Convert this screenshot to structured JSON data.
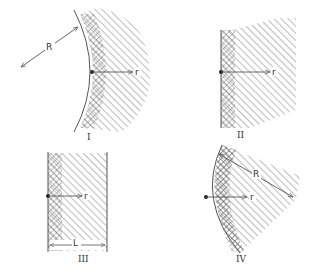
{
  "colors": {
    "line": "#555555",
    "hatch": "#777777",
    "background": "#ffffff"
  },
  "panels": [
    {
      "id": "I",
      "label": "I",
      "description": "Concave cylindrical surface (center of curvature to the left) with radius R; cross-hatched boundary layer and diagonally hatched region; radial coordinate r",
      "radius_label": "R",
      "coord_label": "r"
    },
    {
      "id": "II",
      "label": "II",
      "description": "Flat planar surface; cross-hatched boundary layer and diagonally hatched semi-infinite region; coordinate r",
      "coord_label": "r"
    },
    {
      "id": "III",
      "label": "III",
      "description": "Flat slab of thickness L between two parallel surfaces; cross-hatched boundary layer; coordinate r",
      "coord_label": "r",
      "thickness_label": "L"
    },
    {
      "id": "IV",
      "label": "IV",
      "description": "Convex cylindrical sector of radius R; cross-hatched boundary layer along arc; coordinate r",
      "radius_label": "R",
      "coord_label": "r"
    }
  ]
}
